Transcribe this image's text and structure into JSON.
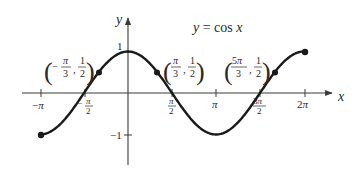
{
  "chart_data": {
    "type": "line",
    "title": "y = cos x",
    "xlabel": "x",
    "ylabel": "y",
    "function": "cos",
    "xlim": [
      -3.14159,
      6.28319
    ],
    "ylim": [
      -1,
      1
    ],
    "grid": false,
    "x_tick_labels": [
      "−π",
      "−π/2",
      "π/2",
      "π",
      "3π/2",
      "2π"
    ],
    "x_tick_values": [
      -3.14159,
      -1.5708,
      1.5708,
      3.14159,
      4.71239,
      6.28319
    ],
    "y_tick_labels": [
      "1",
      "−1"
    ],
    "y_tick_values": [
      1,
      -1
    ],
    "endpoints": [
      {
        "x": -3.14159,
        "y": -1,
        "label": "(−π, −1)"
      },
      {
        "x": 6.28319,
        "y": 1,
        "label": "(2π, 1)"
      }
    ],
    "marked_points": [
      {
        "x": -1.0472,
        "y": 0.5,
        "label": "(−π/3, 1/2)"
      },
      {
        "x": 1.0472,
        "y": 0.5,
        "label": "(π/3, 1/2)"
      },
      {
        "x": 5.23599,
        "y": 0.5,
        "label": "(5π/3, 1/2)"
      }
    ]
  },
  "labels": {
    "title_lhs": "y",
    "title_eq": " = cos ",
    "title_rhs": "x",
    "x_axis": "x",
    "y_axis": "y",
    "y_one": "1",
    "y_neg_one": "−1",
    "pi": "π",
    "minus": "−",
    "two": "2",
    "three": "3",
    "one": "1",
    "five": "5"
  },
  "colors": {
    "curve": "#1a1a1a",
    "axis": "#3a3a3a",
    "text": "#2a2a2a"
  }
}
